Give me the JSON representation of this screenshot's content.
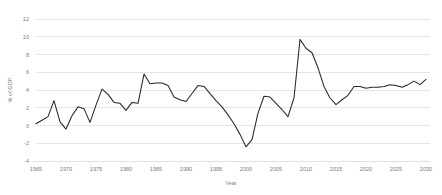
{
  "chart_data": {
    "type": "line",
    "title": "",
    "xlabel": "Year",
    "ylabel": "% of GDP",
    "xlim": [
      1965,
      2030
    ],
    "ylim": [
      -4,
      12
    ],
    "ytick_step": 2,
    "xtick_step": 5,
    "grid": "horizontal",
    "legend": "none",
    "line_color": "#262626",
    "grid_color": "#d9d9d9",
    "tick_color": "#7d7d7d",
    "yticks": [
      "12",
      "10",
      "8",
      "6",
      "4",
      "2",
      "0",
      "-2",
      "-4"
    ],
    "ytick_values": [
      12,
      10,
      8,
      6,
      4,
      2,
      0,
      -2,
      -4
    ],
    "xticks": [
      "1965",
      "1970",
      "1975",
      "1980",
      "1985",
      "1990",
      "1995",
      "2000",
      "2005",
      "2010",
      "2015",
      "2020",
      "2025",
      "2030"
    ],
    "xtick_values": [
      1965,
      1970,
      1975,
      1980,
      1985,
      1990,
      1995,
      2000,
      2005,
      2010,
      2015,
      2020,
      2025,
      2030
    ],
    "x": [
      1965,
      1966,
      1967,
      1968,
      1969,
      1970,
      1971,
      1972,
      1973,
      1974,
      1975,
      1976,
      1977,
      1978,
      1979,
      1980,
      1981,
      1982,
      1983,
      1984,
      1985,
      1986,
      1987,
      1988,
      1989,
      1990,
      1991,
      1992,
      1993,
      1994,
      1995,
      1996,
      1997,
      1998,
      1999,
      2000,
      2001,
      2002,
      2003,
      2004,
      2005,
      2006,
      2007,
      2008,
      2009,
      2010,
      2011,
      2012,
      2013,
      2014,
      2015,
      2016,
      2017,
      2018,
      2019,
      2020,
      2021,
      2022,
      2023,
      2024,
      2025,
      2026,
      2027,
      2028,
      2029,
      2030
    ],
    "values": [
      0.2,
      0.6,
      1.0,
      2.8,
      0.4,
      -0.4,
      1.1,
      2.1,
      1.9,
      0.35,
      2.3,
      4.1,
      3.5,
      2.6,
      2.5,
      1.7,
      2.6,
      2.5,
      5.8,
      4.7,
      4.8,
      4.8,
      4.5,
      3.2,
      2.9,
      2.7,
      3.6,
      4.5,
      4.4,
      3.6,
      2.8,
      2.1,
      1.2,
      0.2,
      -1.0,
      -2.4,
      -1.6,
      1.4,
      3.3,
      3.2,
      2.5,
      1.8,
      1.0,
      3.1,
      9.7,
      8.7,
      8.2,
      6.5,
      4.4,
      3.1,
      2.35,
      2.9,
      3.4,
      4.4,
      4.4,
      4.2,
      4.3,
      4.3,
      4.4,
      4.6,
      4.5,
      4.3,
      4.6,
      5.0,
      4.6,
      5.2
    ],
    "series": [
      {
        "name": "",
        "values": [
          0.2,
          0.6,
          1.0,
          2.8,
          0.4,
          -0.4,
          1.1,
          2.1,
          1.9,
          0.35,
          2.3,
          4.1,
          3.5,
          2.6,
          2.5,
          1.7,
          2.6,
          2.5,
          5.8,
          4.7,
          4.8,
          4.8,
          4.5,
          3.2,
          2.9,
          2.7,
          3.6,
          4.5,
          4.4,
          3.6,
          2.8,
          2.1,
          1.2,
          0.2,
          -1.0,
          -2.4,
          -1.6,
          1.4,
          3.3,
          3.2,
          2.5,
          1.8,
          1.0,
          3.1,
          9.7,
          8.7,
          8.2,
          6.5,
          4.4,
          3.1,
          2.35,
          2.9,
          3.4,
          4.4,
          4.4,
          4.2,
          4.3,
          4.3,
          4.4,
          4.6,
          4.5,
          4.3,
          4.6,
          5.0,
          4.6,
          5.2
        ]
      }
    ]
  }
}
